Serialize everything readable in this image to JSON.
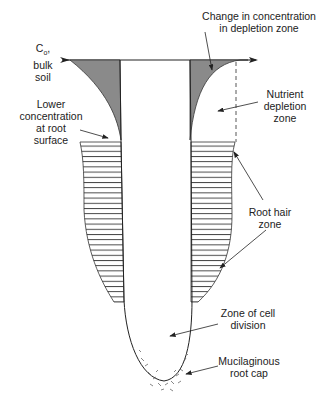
{
  "diagram": {
    "type": "root nutrient depletion diagram",
    "labels": {
      "change_line1": "Change in concentration",
      "change_line2": "in depletion zone",
      "bulk_line1": "C",
      "bulk_sub": "o",
      "bulk_comma": ",",
      "bulk_line2": "bulk",
      "bulk_line3": "soil",
      "lower_line1": "Lower",
      "lower_line2": "concentration",
      "lower_line3": "at root",
      "lower_line4": "surface",
      "nutrient_line1": "Nutrient",
      "nutrient_line2": "depletion",
      "nutrient_line3": "zone",
      "roothair_line1": "Root hair",
      "roothair_line2": "zone",
      "division_line1": "Zone of cell",
      "division_line2": "division",
      "cap_line1": "Mucilaginous",
      "cap_line2": "root cap"
    },
    "colors": {
      "line": "#222222",
      "depletion_fill": "#8a8a8a",
      "background": "#ffffff"
    }
  }
}
